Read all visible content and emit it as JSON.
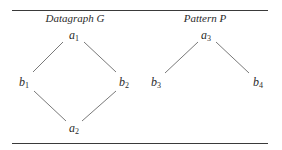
{
  "figure": {
    "rules": [
      "top",
      "bottom"
    ],
    "panels": [
      {
        "title": "Datagraph G",
        "nodes": [
          {
            "id": "a1",
            "letter": "a",
            "sub": "1"
          },
          {
            "id": "b1",
            "letter": "b",
            "sub": "1"
          },
          {
            "id": "b2",
            "letter": "b",
            "sub": "2"
          },
          {
            "id": "a2",
            "letter": "a",
            "sub": "2"
          }
        ],
        "edges": [
          [
            "a1",
            "b1"
          ],
          [
            "a1",
            "b2"
          ],
          [
            "b1",
            "a2"
          ],
          [
            "b2",
            "a2"
          ]
        ]
      },
      {
        "title": "Pattern P",
        "nodes": [
          {
            "id": "a3",
            "letter": "a",
            "sub": "3"
          },
          {
            "id": "b3",
            "letter": "b",
            "sub": "3"
          },
          {
            "id": "b4",
            "letter": "b",
            "sub": "4"
          }
        ],
        "edges": [
          [
            "a3",
            "b3"
          ],
          [
            "a3",
            "b4"
          ]
        ]
      }
    ]
  }
}
